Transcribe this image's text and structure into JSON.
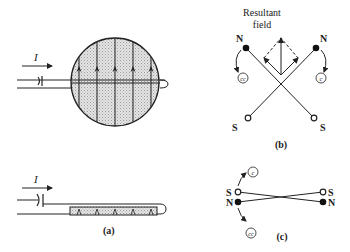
{
  "figure": {
    "panel_a": {
      "caption": "(a)",
      "current_label": "I",
      "field_line_count": 5
    },
    "panel_b": {
      "caption": "(b)",
      "resultant_label_line1": "Resultant",
      "resultant_label_line2": "field",
      "left_top_pole": "N",
      "right_top_pole": "N",
      "left_bottom_pole": "S",
      "right_bottom_pole": "S",
      "left_rotation": "cc",
      "right_rotation": "c"
    },
    "panel_c": {
      "caption": "(c)",
      "left_upper_pole": "S",
      "left_lower_pole": "N",
      "right_upper_pole": "S",
      "right_lower_pole": "N",
      "upper_rotation": "c",
      "lower_rotation": "cc"
    }
  }
}
